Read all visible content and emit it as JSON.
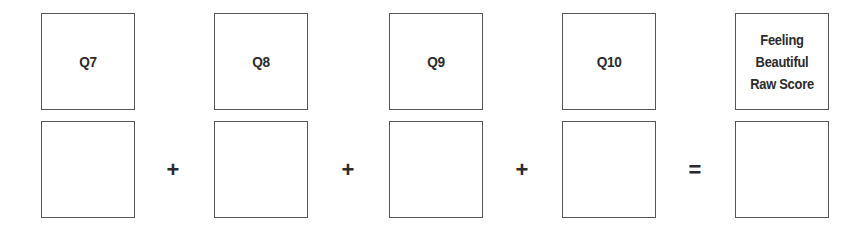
{
  "columns": [
    {
      "header": "Q7",
      "value": ""
    },
    {
      "header": "Q8",
      "value": ""
    },
    {
      "header": "Q9",
      "value": ""
    },
    {
      "header": "Q10",
      "value": ""
    },
    {
      "header": "Feeling\nBeautiful\nRaw Score",
      "value": ""
    }
  ],
  "operators": [
    "+",
    "+",
    "+",
    "="
  ]
}
